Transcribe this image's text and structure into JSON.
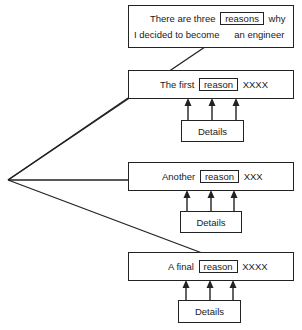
{
  "thesis": {
    "line1_before": "There are three",
    "keyword": "reasons",
    "line1_after": "why",
    "line2_part1": "I decided to become",
    "line2_part2": "an engineer"
  },
  "reasons": [
    {
      "prefix": "The first",
      "keyword": "reason",
      "suffix": "XXXX",
      "details_label": "Details",
      "arrow_count": 3
    },
    {
      "prefix": "Another",
      "keyword": "reason",
      "suffix": "XXX",
      "details_label": "Details",
      "arrow_count": 3
    },
    {
      "prefix": "A final",
      "keyword": "reason",
      "suffix": "XXXX",
      "details_label": "Details",
      "arrow_count": 3
    }
  ],
  "colors": {
    "stroke": "#222222",
    "background": "#ffffff"
  }
}
